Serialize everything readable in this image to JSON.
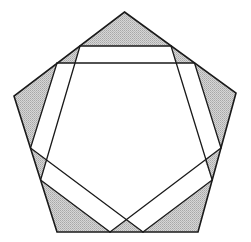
{
  "diagram": {
    "title": "",
    "colors": {
      "stroke": "#1a1a1a",
      "shade": "#c9c9c9",
      "shade_dot": "#9a9a9a",
      "background": "#ffffff"
    },
    "pentagon": {
      "vertices": [
        [
          124.5,
          12
        ],
        [
          236,
          93
        ],
        [
          198,
          232
        ],
        [
          57,
          232
        ],
        [
          14,
          96
        ]
      ]
    },
    "bands": [
      {
        "name": "top-band",
        "lines": [
          [
            [
              80,
              46
            ],
            [
              171,
              46
            ]
          ],
          [
            [
              57,
              63
            ],
            [
              194.5,
              63
            ]
          ]
        ]
      },
      {
        "name": "left-band",
        "lines": [
          [
            [
              57,
              63
            ],
            [
              30.5,
              148
            ]
          ],
          [
            [
              80,
              46
            ],
            [
              40.6,
              180
            ]
          ]
        ]
      },
      {
        "name": "right-band",
        "lines": [
          [
            [
              194.5,
              63
            ],
            [
              221,
              148
            ]
          ],
          [
            [
              171,
              46
            ],
            [
              212.2,
              180
            ]
          ]
        ]
      },
      {
        "name": "bottom-left-band",
        "lines": [
          [
            [
              30.5,
              148
            ],
            [
              143,
              232
            ]
          ],
          [
            [
              40.6,
              180
            ],
            [
              110,
              232
            ]
          ]
        ]
      },
      {
        "name": "bottom-right-band",
        "lines": [
          [
            [
              221,
              148
            ],
            [
              110,
              232
            ]
          ],
          [
            [
              212.2,
              180
            ],
            [
              143,
              232
            ]
          ]
        ]
      }
    ],
    "shaded_regions": [
      {
        "name": "top-corner",
        "points": [
          [
            124.5,
            12
          ],
          [
            171,
            46
          ],
          [
            80,
            46
          ]
        ]
      },
      {
        "name": "top-left-small",
        "points": [
          [
            80,
            46
          ],
          [
            75,
            63
          ],
          [
            57,
            63
          ]
        ]
      },
      {
        "name": "top-right-small",
        "points": [
          [
            171,
            46
          ],
          [
            175.5,
            63
          ],
          [
            194.5,
            63
          ]
        ]
      },
      {
        "name": "left-corner",
        "points": [
          [
            57,
            63
          ],
          [
            14,
            96
          ],
          [
            30.5,
            148
          ]
        ]
      },
      {
        "name": "right-corner",
        "points": [
          [
            194.5,
            63
          ],
          [
            236,
            93
          ],
          [
            221,
            148
          ]
        ]
      },
      {
        "name": "lower-left-small",
        "points": [
          [
            30.5,
            148
          ],
          [
            46.8,
            160
          ],
          [
            40.6,
            180
          ]
        ]
      },
      {
        "name": "lower-right-small",
        "points": [
          [
            221,
            148
          ],
          [
            204.5,
            160
          ],
          [
            212.2,
            180
          ]
        ]
      },
      {
        "name": "bottom-left-corner",
        "points": [
          [
            40.6,
            180
          ],
          [
            57,
            232
          ],
          [
            110,
            232
          ]
        ]
      },
      {
        "name": "bottom-right-corner",
        "points": [
          [
            212.2,
            180
          ],
          [
            198,
            232
          ],
          [
            143,
            232
          ]
        ]
      },
      {
        "name": "bottom-center",
        "points": [
          [
            110,
            232
          ],
          [
            126.5,
            219.5
          ],
          [
            143,
            232
          ]
        ]
      }
    ]
  }
}
